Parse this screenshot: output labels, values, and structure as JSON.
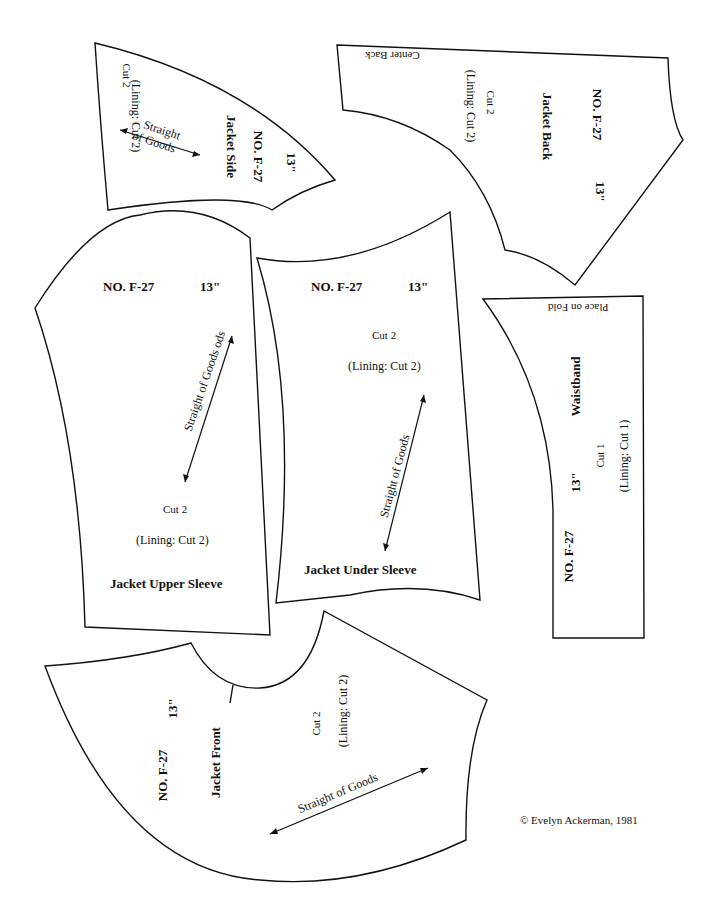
{
  "pattern_number": "NO. F-27",
  "size": "13\"",
  "pieces": {
    "jacket_side": {
      "name": "Jacket Side",
      "cut": "Cut 2",
      "lining": "(Lining: Cut 2)",
      "grain": "Straight of Goods",
      "grain_line2": "of Goods",
      "grain_line1": "Straight"
    },
    "jacket_back": {
      "name": "Jacket Back",
      "cut": "Cut 2",
      "lining": "(Lining: Cut 2)",
      "edge_note": "Center Back"
    },
    "jacket_upper_sleeve": {
      "name": "Jacket Upper Sleeve",
      "cut": "Cut 2",
      "lining": "(Lining: Cut 2)",
      "grain": "Straight of Goods ods"
    },
    "jacket_under_sleeve": {
      "name": "Jacket Under Sleeve",
      "cut": "Cut 2",
      "lining": "(Lining: Cut 2)",
      "grain": "Straight of Goods"
    },
    "waistband": {
      "name": "Waistband",
      "cut": "Cut 1",
      "lining": "(Lining: Cut 1)",
      "edge_note": "Place on Fold"
    },
    "jacket_front": {
      "name": "Jacket Front",
      "cut": "Cut 2",
      "lining": "(Lining: Cut 2)",
      "grain": "Straight of Goods"
    }
  },
  "copyright": "© Evelyn Ackerman, 1981"
}
